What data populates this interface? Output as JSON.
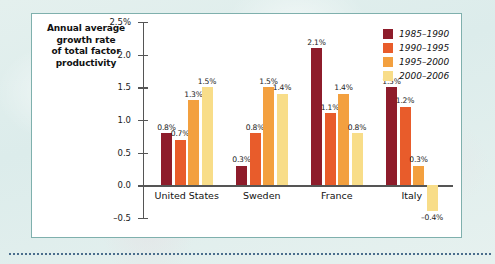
{
  "chart_data": {
    "type": "bar",
    "title": "",
    "ylabel": "Annual average growth rate of total factor productivity",
    "ylabel_lines": [
      "Annual average",
      "growth rate",
      "of total factor",
      "productivity"
    ],
    "xlabel": "",
    "categories": [
      "United States",
      "Sweden",
      "France",
      "Italy"
    ],
    "ylim": [
      -0.5,
      2.5
    ],
    "yticks": [
      -0.5,
      0.0,
      0.5,
      1.0,
      1.5,
      2.0,
      2.5
    ],
    "ytick_labels": [
      "-0.5",
      "0.0",
      "0.5",
      "1.0",
      "1.5",
      "2.0",
      "2.5%"
    ],
    "grid": false,
    "legend_position": "top-right",
    "series": [
      {
        "name": "1985-1990",
        "color": "#8e1c2b",
        "values": [
          0.8,
          0.3,
          2.1,
          1.5
        ],
        "labels": [
          "0.8%",
          "0.3%",
          "2.1%",
          "1.5%"
        ]
      },
      {
        "name": "1990-1995",
        "color": "#e85c2b",
        "values": [
          0.7,
          0.8,
          1.1,
          1.2
        ],
        "labels": [
          "0.7%",
          "0.8%",
          "1.1%",
          "1.2%"
        ]
      },
      {
        "name": "1995-2000",
        "color": "#f3a03f",
        "values": [
          1.3,
          1.5,
          1.4,
          0.3
        ],
        "labels": [
          "1.3%",
          "1.5%",
          "1.4%",
          "0.3%"
        ]
      },
      {
        "name": "2000-2006",
        "color": "#f8dd89",
        "values": [
          1.5,
          1.4,
          0.8,
          -0.4
        ],
        "labels": [
          "1.5%",
          "1.4%",
          "0.8%",
          "-0.4%"
        ]
      }
    ]
  },
  "style": {
    "panel_background": "#ffffff",
    "panel_border": "#7fb0ad",
    "page_background": "#dfeeec",
    "axis_color": "#555555",
    "text_color": "#111111"
  }
}
